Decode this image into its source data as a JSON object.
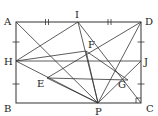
{
  "figure": {
    "type": "geometry-diagram",
    "points": [
      {
        "name": "A",
        "label": "A"
      },
      {
        "name": "B",
        "label": "B"
      },
      {
        "name": "C",
        "label": "C"
      },
      {
        "name": "D",
        "label": "D"
      },
      {
        "name": "I",
        "label": "I"
      },
      {
        "name": "H",
        "label": "H"
      },
      {
        "name": "J",
        "label": "J"
      },
      {
        "name": "P",
        "label": "P"
      },
      {
        "name": "E",
        "label": "E"
      },
      {
        "name": "F",
        "label": "F"
      },
      {
        "name": "G",
        "label": "G"
      }
    ],
    "segments": [
      [
        "A",
        "P"
      ],
      [
        "I",
        "H"
      ],
      [
        "I",
        "P"
      ],
      [
        "I",
        "C"
      ],
      [
        "D",
        "E"
      ],
      [
        "H",
        "J"
      ],
      [
        "H",
        "P"
      ],
      [
        "E",
        "G"
      ],
      [
        "E",
        "P"
      ],
      [
        "F",
        "P"
      ],
      [
        "F",
        "G"
      ],
      [
        "J",
        "P"
      ],
      [
        "D",
        "P"
      ],
      [
        "H",
        "F"
      ]
    ],
    "equal_marks": {
      "double": [
        "AI",
        "ID"
      ],
      "single": [
        "AH",
        "HB",
        "DJ",
        "JC"
      ]
    },
    "right_angle_at": "C"
  }
}
